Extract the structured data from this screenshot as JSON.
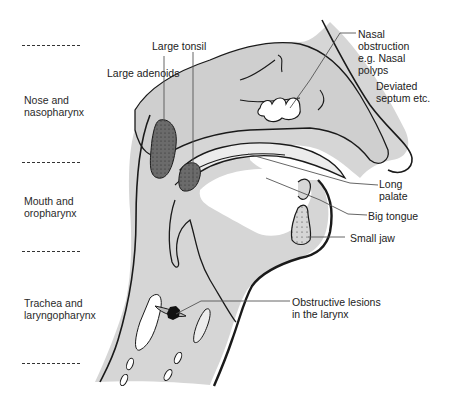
{
  "diagram": {
    "colors": {
      "tissue_fill": "#d6d6d6",
      "light_fill": "#ececec",
      "lesion_fill": "#6b6b6b",
      "outline": "#1a1a1a",
      "leader_line": "#555555",
      "background": "#ffffff"
    },
    "regions": [
      {
        "id": "nose",
        "label": "Nose and\nnasopharynx"
      },
      {
        "id": "mouth",
        "label": "Mouth and\noropharynx"
      },
      {
        "id": "trachea",
        "label": "Trachea and\nlaryngopharynx"
      }
    ],
    "annotations": [
      {
        "id": "large-adenoids",
        "label": "Large adenoids"
      },
      {
        "id": "large-tonsil",
        "label": "Large tonsil"
      },
      {
        "id": "nasal-obstruction",
        "label": "Nasal\nobstruction\ne.g. Nasal\npolyps"
      },
      {
        "id": "deviated-septum",
        "label": "Deviated\nseptum etc."
      },
      {
        "id": "long-palate",
        "label": "Long\npalate"
      },
      {
        "id": "big-tongue",
        "label": "Big tongue"
      },
      {
        "id": "small-jaw",
        "label": "Small jaw"
      },
      {
        "id": "obstructive-lesions",
        "label": "Obstructive lesions\nin the larynx"
      }
    ],
    "dividers": 4
  }
}
